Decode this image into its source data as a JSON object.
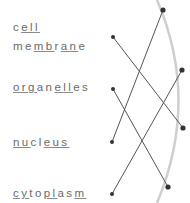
{
  "terms": [
    {
      "id": "cell-membrane",
      "lines": [
        [
          {
            "t": "c",
            "u": false
          },
          {
            "t": "e",
            "u": true
          },
          {
            "t": "l",
            "u": true
          },
          {
            "t": "l",
            "u": true
          }
        ],
        [
          {
            "t": "me",
            "u": false
          },
          {
            "t": "m",
            "u": true
          },
          {
            "t": "b",
            "u": true
          },
          {
            "t": "r",
            "u": false
          },
          {
            "t": "a",
            "u": true
          },
          {
            "t": "n",
            "u": true
          },
          {
            "t": "e",
            "u": false
          }
        ]
      ],
      "text": "cell membrane",
      "dot": [
        113,
        37
      ]
    },
    {
      "id": "organelles",
      "lines": [
        [
          {
            "t": "org",
            "u": true
          },
          {
            "t": "an",
            "u": false
          },
          {
            "t": "e",
            "u": true
          },
          {
            "t": "l",
            "u": true
          },
          {
            "t": "l",
            "u": true
          },
          {
            "t": "es",
            "u": false
          }
        ]
      ],
      "text": "organelles",
      "dot": [
        113,
        89
      ]
    },
    {
      "id": "nucleus",
      "lines": [
        [
          {
            "t": "nu",
            "u": true
          },
          {
            "t": "cl",
            "u": false
          },
          {
            "t": "eus",
            "u": true
          }
        ]
      ],
      "text": "nucleus",
      "dot": [
        112,
        142
      ]
    },
    {
      "id": "cytoplasm",
      "lines": [
        [
          {
            "t": "cy",
            "u": true
          },
          {
            "t": "to",
            "u": false
          },
          {
            "t": "p",
            "u": true
          },
          {
            "t": "l",
            "u": true
          },
          {
            "t": "as",
            "u": false
          },
          {
            "t": "m",
            "u": true
          }
        ]
      ],
      "text": "cytoplasm",
      "dot": [
        112,
        194
      ]
    }
  ],
  "right_dots": [
    [
      163,
      10
    ],
    [
      182,
      70
    ],
    [
      183,
      128
    ],
    [
      168,
      187
    ]
  ],
  "connections": [
    [
      0,
      2
    ],
    [
      1,
      3
    ],
    [
      2,
      0
    ],
    [
      3,
      1
    ]
  ],
  "colors": {
    "text": "#6a6a6a",
    "line": "#555555",
    "dot": "#333333",
    "arc": "#cfcfcf"
  }
}
